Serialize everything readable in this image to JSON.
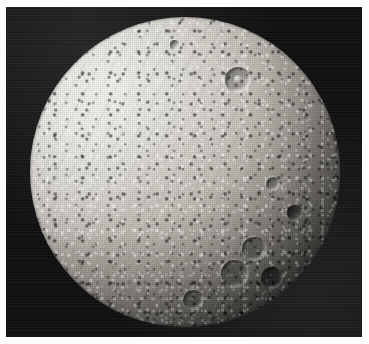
{
  "page": {
    "background_color": "#fdfdfc",
    "kind": "printed-photograph-plate",
    "caption": ""
  },
  "photo": {
    "name": "spacecraft-image-of-icy-moon",
    "subject": "heavily cratered icy satellite",
    "color_mode": "grayscale",
    "sky_color": "#060606",
    "frame": {
      "x": 6,
      "y": 7,
      "width": 356,
      "height": 330
    },
    "illumination": {
      "light_direction": "upper-left",
      "terminator_side": "right",
      "bright_limb_side": "left"
    },
    "disk": {
      "center_x": 185,
      "center_y": 172,
      "radius": 155,
      "highlight_color": "#f2f1ee",
      "midtone_color": "#b8b4ac",
      "shadow_color": "#131312",
      "clipped_edges": "bottom"
    },
    "terrain_regions": [
      {
        "name": "bright-smooth-plains",
        "location": "western (left) hemisphere",
        "description": "high-albedo, comparatively smooth terrain crossed by faint linear grooves"
      },
      {
        "name": "dense-crater-field",
        "location": "eastern (right) hemisphere toward terminator",
        "description": "saturated small-crater terrain rendered as high-contrast speckle"
      },
      {
        "name": "mid-latitude-cratered-terrain",
        "location": "disk centre",
        "description": "moderate grey cratered surface"
      }
    ],
    "craters": [
      {
        "name": "central-peak-crater",
        "cx": 235,
        "cy": 78,
        "diameter": 26,
        "has_central_peak": true
      },
      {
        "name": "large-crater-lower-right-a",
        "cx": 262,
        "cy": 247,
        "diameter": 24,
        "has_central_peak": false
      },
      {
        "name": "large-crater-lower-right-b",
        "cx": 243,
        "cy": 271,
        "diameter": 28,
        "has_central_peak": false
      },
      {
        "name": "large-crater-lower-right-c",
        "cx": 283,
        "cy": 276,
        "diameter": 22,
        "has_central_peak": false
      },
      {
        "name": "crater-right-limb-upper",
        "cx": 300,
        "cy": 214,
        "diameter": 16,
        "has_central_peak": false
      },
      {
        "name": "crater-lower-centre",
        "cx": 205,
        "cy": 300,
        "diameter": 20,
        "has_central_peak": false
      },
      {
        "name": "crater-mid-right",
        "cx": 276,
        "cy": 186,
        "diameter": 14,
        "has_central_peak": false
      },
      {
        "name": "small-crater-top",
        "cx": 180,
        "cy": 35,
        "diameter": 9,
        "has_central_peak": false
      }
    ]
  }
}
